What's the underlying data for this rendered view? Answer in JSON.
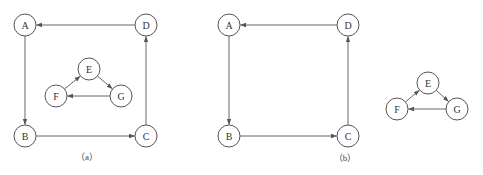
{
  "figure": {
    "node_radius": 11,
    "colors": {
      "stroke": "#555555",
      "edge": "#666666",
      "text": "#333333",
      "background": "#ffffff"
    },
    "panels": [
      {
        "id": "a",
        "caption": "（a）",
        "caption_pos": [
          87,
          160
        ],
        "nodes": [
          {
            "id": "A",
            "label": "A",
            "x": 25,
            "y": 25
          },
          {
            "id": "D",
            "label": "D",
            "x": 146,
            "y": 25
          },
          {
            "id": "B",
            "label": "B",
            "x": 25,
            "y": 136
          },
          {
            "id": "C",
            "label": "C",
            "x": 146,
            "y": 136
          },
          {
            "id": "E",
            "label": "E",
            "x": 89,
            "y": 69
          },
          {
            "id": "F",
            "label": "F",
            "x": 56,
            "y": 96
          },
          {
            "id": "G",
            "label": "G",
            "x": 121,
            "y": 96
          }
        ],
        "edges": [
          {
            "from": "D",
            "to": "A"
          },
          {
            "from": "A",
            "to": "B"
          },
          {
            "from": "B",
            "to": "C"
          },
          {
            "from": "C",
            "to": "D"
          },
          {
            "from": "F",
            "to": "E"
          },
          {
            "from": "E",
            "to": "G"
          },
          {
            "from": "G",
            "to": "F"
          }
        ]
      },
      {
        "id": "b",
        "caption": "（b）",
        "caption_pos": [
          345,
          161
        ],
        "nodes": [
          {
            "id": "A",
            "label": "A",
            "x": 229,
            "y": 25
          },
          {
            "id": "D",
            "label": "D",
            "x": 348,
            "y": 25
          },
          {
            "id": "B",
            "label": "B",
            "x": 229,
            "y": 136
          },
          {
            "id": "C",
            "label": "C",
            "x": 348,
            "y": 136
          },
          {
            "id": "E",
            "label": "E",
            "x": 428,
            "y": 83
          },
          {
            "id": "F",
            "label": "F",
            "x": 397,
            "y": 109
          },
          {
            "id": "G",
            "label": "G",
            "x": 457,
            "y": 109
          }
        ],
        "edges": [
          {
            "from": "D",
            "to": "A"
          },
          {
            "from": "A",
            "to": "B"
          },
          {
            "from": "B",
            "to": "C"
          },
          {
            "from": "C",
            "to": "D"
          },
          {
            "from": "F",
            "to": "E"
          },
          {
            "from": "E",
            "to": "G"
          },
          {
            "from": "G",
            "to": "F"
          }
        ]
      }
    ]
  }
}
